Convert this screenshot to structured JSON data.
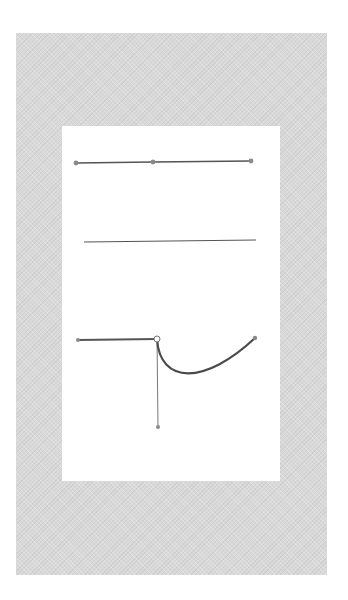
{
  "diagram": {
    "title": "",
    "colors": {
      "background": "#ffffff",
      "frame": "#d9d9d9",
      "panel": "#ffffff",
      "stroke": "#555555",
      "anchor_fill": "#8a8a8a",
      "handle_line": "#777777"
    },
    "paths": [
      {
        "id": "straight-path-with-anchors",
        "type": "straight-line",
        "anchors": [
          [
            76,
            163
          ],
          [
            153,
            162
          ],
          [
            251,
            161
          ]
        ],
        "stroke_width": 1.6
      },
      {
        "id": "plain-line",
        "type": "straight-line",
        "anchors": [
          [
            84,
            242
          ],
          [
            256,
            240
          ]
        ],
        "stroke_width": 1.2,
        "show_anchors": false
      },
      {
        "id": "corner-curve-path",
        "type": "corner-to-bezier",
        "segment_1": {
          "from": [
            78,
            340
          ],
          "to": [
            157,
            339
          ]
        },
        "corner_anchor": [
          157,
          339
        ],
        "curve": {
          "from": [
            157,
            339
          ],
          "c1": [
            160,
            385
          ],
          "c2": [
            205,
            385
          ],
          "to": [
            255,
            338
          ]
        },
        "end_anchor": [
          255,
          338
        ],
        "handle": {
          "from": [
            157,
            339
          ],
          "to": [
            158,
            427
          ]
        },
        "stroke_width": 2.2
      }
    ]
  }
}
